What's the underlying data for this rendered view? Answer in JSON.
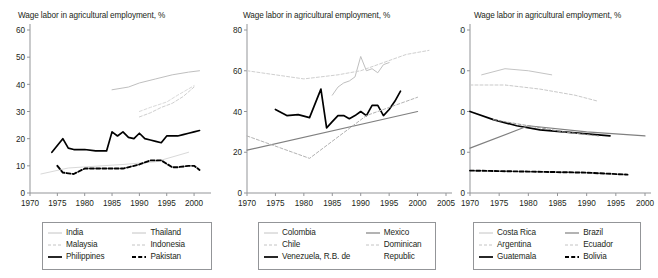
{
  "figure": {
    "width": 658,
    "height": 278,
    "background": "#ffffff",
    "axis_color": "#939598",
    "text_color": "#231f20"
  },
  "chart_data": [
    {
      "type": "line",
      "panel_index": 0,
      "title": "Wage labor in agricultural employment, %",
      "xlabel": "",
      "ylabel": "",
      "xlim": [
        1970,
        2002
      ],
      "ylim": [
        0,
        60
      ],
      "yticks": [
        0,
        10,
        20,
        30,
        40,
        50,
        60
      ],
      "xticks": [
        1970,
        1975,
        1980,
        1985,
        1990,
        1995,
        2000
      ],
      "grid": false,
      "legend_position": "below",
      "series": [
        {
          "name": "India",
          "style": "solid",
          "color": "#d9d9d9",
          "x": [
            1972,
            1977,
            1983,
            1987,
            1993,
            1999
          ],
          "y": [
            7,
            9.2,
            10,
            10.5,
            11.5,
            15
          ]
        },
        {
          "name": "Malaysia",
          "style": "dashed",
          "color": "#d9d9d9",
          "x": [
            1990,
            1992,
            1995,
            1997,
            2000
          ],
          "y": [
            30,
            31.5,
            33.5,
            36,
            39.5
          ]
        },
        {
          "name": "Philippines",
          "style": "solid",
          "color": "#000000",
          "x": [
            1974,
            1976,
            1977,
            1978,
            1980,
            1982,
            1984,
            1985,
            1986,
            1987,
            1988,
            1989,
            1990,
            1991,
            1992,
            1993,
            1994,
            1995,
            1996,
            1997,
            1998,
            1999,
            2000,
            2001
          ],
          "y": [
            15,
            20,
            16.5,
            16,
            16,
            15.5,
            15.5,
            22.5,
            21,
            22.5,
            20.5,
            20,
            22,
            20,
            19.5,
            19,
            18.5,
            21,
            21,
            21,
            21.5,
            22,
            22.5,
            23
          ]
        },
        {
          "name": "Thailand",
          "style": "solid",
          "color": "#bfbfbf",
          "x": [
            1985,
            1988,
            1990,
            1993,
            1996,
            1999,
            2001
          ],
          "y": [
            38,
            39,
            40.5,
            42,
            43.5,
            44.5,
            45
          ]
        },
        {
          "name": "Indonesia",
          "style": "dashed-light",
          "color": "#cfcfcf",
          "x": [
            1990,
            1992,
            1994,
            1996,
            1998,
            2000
          ],
          "y": [
            28,
            29.5,
            31.5,
            33,
            35.5,
            39
          ]
        },
        {
          "name": "Pakistan",
          "style": "dashed-heavy",
          "color": "#000000",
          "x": [
            1975,
            1976,
            1978,
            1980,
            1985,
            1987,
            1990,
            1992,
            1993,
            1994,
            1996,
            1997,
            1999,
            2000,
            2001
          ],
          "y": [
            10,
            7.5,
            7,
            9,
            9,
            9,
            10.5,
            12,
            12,
            12,
            9.5,
            9.5,
            10,
            10,
            8.5
          ]
        }
      ]
    },
    {
      "type": "line",
      "panel_index": 1,
      "title": "Wage labor in agricultural employment, %",
      "xlabel": "",
      "ylabel": "",
      "xlim": [
        1970,
        2005
      ],
      "ylim": [
        0,
        80
      ],
      "yticks": [
        0,
        20,
        40,
        60,
        80
      ],
      "xticks": [
        1970,
        1975,
        1980,
        1985,
        1990,
        1995,
        2000,
        2005
      ],
      "grid": false,
      "legend_position": "below",
      "series": [
        {
          "name": "Colombia",
          "style": "solid",
          "color": "#bfbfbf",
          "x": [
            1985,
            1986,
            1987,
            1988,
            1989,
            1990,
            1991,
            1992,
            1993,
            1994,
            1995
          ],
          "y": [
            48,
            52,
            54,
            55,
            57,
            67,
            60,
            61,
            59,
            63,
            64
          ]
        },
        {
          "name": "Chile",
          "style": "dashed-light",
          "color": "#cfcfcf",
          "x": [
            1970,
            1980,
            1986,
            1990,
            1994,
            1998,
            2002
          ],
          "y": [
            60,
            56,
            58,
            60,
            64,
            68,
            70
          ]
        },
        {
          "name": "Venezuela, R.B. de",
          "style": "solid",
          "color": "#000000",
          "x": [
            1975,
            1977,
            1979,
            1981,
            1982,
            1983,
            1984,
            1985,
            1986,
            1987,
            1988,
            1989,
            1990,
            1991,
            1992,
            1993,
            1994,
            1995,
            1996,
            1997
          ],
          "y": [
            41,
            38,
            38.5,
            37,
            44,
            51,
            32,
            35,
            38,
            38,
            36.5,
            38,
            40,
            38,
            43,
            43,
            38,
            41,
            45,
            50
          ]
        },
        {
          "name": "Mexico",
          "style": "solid-gray",
          "color": "#808080",
          "x": [
            1970,
            2000
          ],
          "y": [
            21,
            40
          ]
        },
        {
          "name": "Dominican Republic",
          "style": "dashed-light",
          "color": "#b3b3b3",
          "x": [
            1970,
            1981,
            1991,
            2000
          ],
          "y": [
            28,
            17,
            38,
            47
          ]
        }
      ]
    },
    {
      "type": "line",
      "panel_index": 2,
      "title": "Wage labor in agricultural employment, %",
      "xlabel": "",
      "ylabel": "",
      "xlim": [
        1970,
        2000
      ],
      "ylim": [
        0,
        80
      ],
      "yticks": [
        0,
        20,
        40,
        60,
        80
      ],
      "xticks": [
        1970,
        1975,
        1980,
        1985,
        1990,
        1995,
        2000
      ],
      "grid": false,
      "legend_position": "below",
      "series": [
        {
          "name": "Costa Rica",
          "style": "solid",
          "color": "#c4c4c4",
          "x": [
            1972,
            1976,
            1980,
            1984
          ],
          "y": [
            58,
            61,
            60,
            58
          ]
        },
        {
          "name": "Argentina",
          "style": "dashed-light",
          "color": "#c9c9c9",
          "x": [
            1970,
            1976,
            1982,
            1988,
            1992
          ],
          "y": [
            53,
            53,
            51,
            48,
            45
          ]
        },
        {
          "name": "Guatemala",
          "style": "solid",
          "color": "#000000",
          "x": [
            1970,
            1974,
            1978,
            1982,
            1986,
            1990,
            1994
          ],
          "y": [
            40,
            36,
            33,
            31,
            30,
            29,
            28
          ]
        },
        {
          "name": "Brazil",
          "style": "solid-gray",
          "color": "#808080",
          "x": [
            1970,
            1980,
            1990,
            2000
          ],
          "y": [
            22,
            33,
            30,
            28
          ]
        },
        {
          "name": "Ecuador",
          "style": "dashed-light",
          "color": "#9a9a9a",
          "x": [
            1974,
            1980,
            1986,
            1992
          ],
          "y": [
            36,
            33,
            30,
            28
          ]
        },
        {
          "name": "Bolivia",
          "style": "dashed-heavy",
          "color": "#000000",
          "x": [
            1970,
            1980,
            1990,
            1997
          ],
          "y": [
            11,
            10.5,
            10,
            9
          ]
        }
      ]
    }
  ],
  "legends": [
    {
      "panel_index": 0,
      "col1": [
        {
          "label": "India",
          "style": "solid-light"
        },
        {
          "label": "Malaysia",
          "style": "dashed-light"
        },
        {
          "label": "Philippines",
          "style": "solid-black"
        }
      ],
      "col2": [
        {
          "label": "Thailand",
          "style": "solid-light"
        },
        {
          "label": "Indonesia",
          "style": "dashed-light"
        },
        {
          "label": "Pakistan",
          "style": "dashed-black"
        }
      ]
    },
    {
      "panel_index": 1,
      "col1": [
        {
          "label": "Colombia",
          "style": "solid-light"
        },
        {
          "label": "Chile",
          "style": "dashed-light"
        },
        {
          "label": "Venezuela, R.B. de",
          "style": "solid-black"
        }
      ],
      "col2": [
        {
          "label": "Mexico",
          "style": "solid-gray"
        },
        {
          "label": "Dominican",
          "style": "dashed-light"
        },
        {
          "label": "Republic",
          "style": "none"
        }
      ]
    },
    {
      "panel_index": 2,
      "col1": [
        {
          "label": "Costa Rica",
          "style": "solid-light"
        },
        {
          "label": "Argentina",
          "style": "dashed-light"
        },
        {
          "label": "Guatemala",
          "style": "solid-black"
        }
      ],
      "col2": [
        {
          "label": "Brazil",
          "style": "solid-gray"
        },
        {
          "label": "Ecuador",
          "style": "dashed-light"
        },
        {
          "label": "Bolivia",
          "style": "dashed-black"
        }
      ]
    }
  ]
}
